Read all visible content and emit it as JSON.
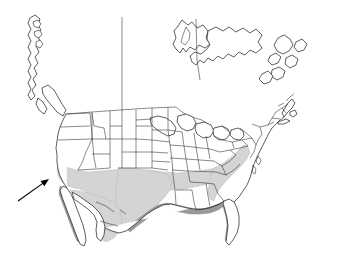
{
  "figure": {
    "type": "distribution-range-map",
    "region": "North America",
    "projection": "conic",
    "background_color": "#ffffff",
    "width": 341,
    "height": 261
  },
  "legend_colors": {
    "range_primary": "#d4d4d4",
    "range_secondary": "#9a9a9a",
    "coastline": "#1a1a1a",
    "state_border": "#2b2b2b",
    "annotation": "#000000"
  },
  "annotation": {
    "arrow_name": "locality-arrow",
    "tail_x": 18,
    "tail_y": 201,
    "tip_x": 49,
    "tip_y": 179,
    "points_to": "southern-california-coast"
  },
  "range_areas": [
    {
      "name": "southern-us-coastal-plain",
      "shade": "light"
    },
    {
      "name": "texas-interior",
      "shade": "light"
    },
    {
      "name": "gulf-coast-band",
      "shade": "dark"
    },
    {
      "name": "florida-peninsula",
      "shade": "dark"
    },
    {
      "name": "atlantic-coastal-plain",
      "shade": "light"
    },
    {
      "name": "baja-california",
      "shade": "dark"
    },
    {
      "name": "northern-mexico",
      "shade": "light"
    }
  ],
  "landmasses": [
    {
      "name": "continental-united-states"
    },
    {
      "name": "canada"
    },
    {
      "name": "mexico"
    },
    {
      "name": "alaska-panhandle"
    },
    {
      "name": "great-lakes"
    },
    {
      "name": "newfoundland"
    },
    {
      "name": "baja-peninsula"
    }
  ]
}
